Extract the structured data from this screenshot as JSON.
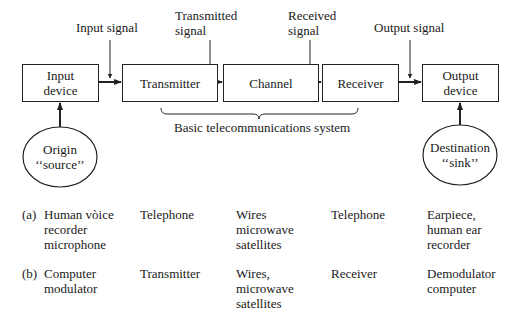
{
  "diagram": {
    "signals": {
      "input": "Input signal",
      "transmitted_l1": "Transmitted",
      "transmitted_l2": "signal",
      "received_l1": "Received",
      "received_l2": "signal",
      "output": "Output signal"
    },
    "blocks": {
      "input_device_l1": "Input",
      "input_device_l2": "device",
      "transmitter": "Transmitter",
      "channel": "Channel",
      "receiver": "Receiver",
      "output_device_l1": "Output",
      "output_device_l2": "device"
    },
    "brace_label": "Basic telecommunications system",
    "origin": {
      "l1": "Origin",
      "l2": "‘‘source’’"
    },
    "destination": {
      "l1": "Destination",
      "l2": "‘‘sink’’"
    }
  },
  "examples": {
    "rows": [
      {
        "tag": "(a)",
        "input": "Human vòice\nrecorder\nmicrophone",
        "transmitter": "Telephone",
        "channel": "Wires\nmicrowave\nsatellites",
        "receiver": "Telephone",
        "output": "Earpiece,\nhuman ear\nrecorder"
      },
      {
        "tag": "(b)",
        "input": "Computer\nmodulator",
        "transmitter": "Transmitter",
        "channel": "Wires,\nmicrowave\nsatellites",
        "receiver": "Receiver",
        "output": "Demodulator\ncomputer"
      }
    ]
  }
}
